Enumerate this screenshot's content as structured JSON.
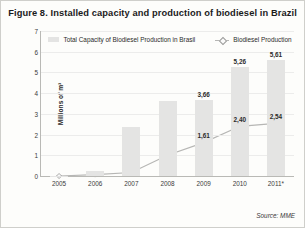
{
  "figure": {
    "title": "Figure 8. Installed capacity and production of biodiesel in Brazil",
    "source": "Source: MME"
  },
  "legend": {
    "items": [
      {
        "label": "Total Capacity of Biodiesel Production in Brasil",
        "marker": "bar-swatch",
        "color": "#e4e4e3"
      },
      {
        "label": "Biodiesel Production",
        "marker": "line-diamond-swatch",
        "color": "#b6b6b4"
      }
    ]
  },
  "chart_data": {
    "type": "bar",
    "title": "Figure 8. Installed capacity and production of biodiesel in Brazil",
    "xlabel": "",
    "ylabel": "Millions of m³",
    "ylim": [
      0,
      7
    ],
    "yticks": [
      "0",
      "1",
      "2",
      "3",
      "4",
      "5",
      "6",
      "7"
    ],
    "ytick_values": [
      0,
      1,
      2,
      3,
      4,
      5,
      6,
      7
    ],
    "grid": true,
    "legend_position": "top-center",
    "categories": [
      "2005",
      "2006",
      "2007",
      "2008",
      "2009",
      "2010",
      "2011*"
    ],
    "series": [
      {
        "name": "Total Capacity of Biodiesel Production in Brasil",
        "type": "bar",
        "color": "#e4e4e3",
        "values": [
          0.02,
          0.23,
          2.35,
          3.6,
          3.66,
          5.26,
          5.61
        ],
        "labels": [
          "",
          "",
          "",
          "",
          "3,66",
          "5,26",
          "5,61"
        ]
      },
      {
        "name": "Biodiesel Production",
        "type": "line",
        "color": "#b6b6b4",
        "marker": "diamond",
        "values": [
          0.0,
          0.07,
          0.17,
          1.0,
          1.61,
          2.4,
          2.54
        ],
        "labels": [
          "",
          "",
          "",
          "",
          "1,61",
          "2,40",
          "2,54"
        ]
      }
    ]
  }
}
